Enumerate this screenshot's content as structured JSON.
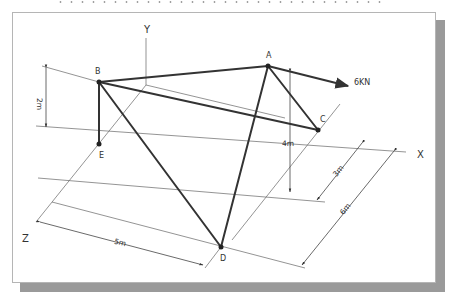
{
  "diagram": {
    "axes": {
      "x_label": "X",
      "y_label": "Y",
      "z_label": "Z"
    },
    "joints": [
      {
        "id": "A",
        "label": "A",
        "x": 268,
        "y": 66
      },
      {
        "id": "B",
        "label": "B",
        "x": 99,
        "y": 82
      },
      {
        "id": "C",
        "label": "C",
        "x": 318,
        "y": 130
      },
      {
        "id": "D",
        "label": "D",
        "x": 221,
        "y": 247
      },
      {
        "id": "E",
        "label": "E",
        "x": 99,
        "y": 144
      }
    ],
    "members": [
      "A-B",
      "A-C",
      "A-D",
      "B-C",
      "B-D",
      "B-E"
    ],
    "load": {
      "label": "6KN",
      "at": "A",
      "direction": "+X"
    },
    "dimensions": [
      {
        "label": "2m",
        "description": "height of B above E"
      },
      {
        "label": "4m",
        "description": "height of A above base"
      },
      {
        "label": "3m",
        "description": "Z offset of A/C line"
      },
      {
        "label": "6m",
        "description": "Z depth to D"
      },
      {
        "label": "5m",
        "description": "X distance to D"
      }
    ]
  },
  "colors": {
    "member": "#333333",
    "construction": "#555555",
    "shadow": "#9a9a9a",
    "frame_border": "#b5b5b5"
  }
}
